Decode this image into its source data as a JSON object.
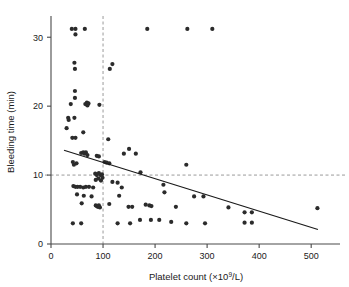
{
  "chart_data": {
    "type": "scatter",
    "title": "",
    "xlabel": "Platelet count (×10⁹/L)",
    "xlabel_parts": {
      "before": "Platelet count (×10",
      "exponent": "9",
      "after": "/L)"
    },
    "ylabel": "Bleeding time (min)",
    "xlim": [
      0,
      540
    ],
    "ylim": [
      0,
      32.5
    ],
    "xticks": [
      0,
      100,
      200,
      300,
      400,
      500
    ],
    "xticklabels": [
      "0",
      "100",
      "200",
      "300",
      "400",
      "500"
    ],
    "yticks": [
      0,
      10,
      20,
      30
    ],
    "yticklabels": [
      "0",
      "10",
      "20",
      "30"
    ],
    "grid": false,
    "legend": null,
    "reference_lines": [
      {
        "name": "vertical-threshold",
        "orientation": "vertical",
        "value": 100,
        "style": "dashed",
        "color": "#9a9a9a"
      },
      {
        "name": "horizontal-threshold",
        "orientation": "horizontal",
        "value": 10,
        "style": "dashed",
        "color": "#9a9a9a"
      }
    ],
    "fit_line": {
      "name": "regression-line",
      "x_start": 25,
      "y_start": 13.6,
      "x_end": 513,
      "y_end": 2.1,
      "color": "#1a1a1a"
    },
    "marker": {
      "shape": "circle",
      "radius": 2.1,
      "color": "#2b2b2b"
    },
    "points": [
      [
        40,
        31.2
      ],
      [
        47,
        31.2
      ],
      [
        47,
        30.4
      ],
      [
        65,
        31.2
      ],
      [
        185,
        31.2
      ],
      [
        262,
        31.2
      ],
      [
        310,
        31.2
      ],
      [
        45,
        26.3
      ],
      [
        46,
        25.4
      ],
      [
        118,
        26.1
      ],
      [
        113,
        25.4
      ],
      [
        46,
        22.2
      ],
      [
        46,
        21.2
      ],
      [
        38,
        20.3
      ],
      [
        66,
        20.3
      ],
      [
        69,
        20.5
      ],
      [
        70,
        20.1
      ],
      [
        72,
        20.4
      ],
      [
        93,
        20.2
      ],
      [
        33,
        18.3
      ],
      [
        34,
        18.0
      ],
      [
        45,
        18.3
      ],
      [
        30,
        16.8
      ],
      [
        62,
        16.2
      ],
      [
        41,
        15.4
      ],
      [
        47,
        15.4
      ],
      [
        110,
        15.2
      ],
      [
        150,
        13.8
      ],
      [
        58,
        13.2
      ],
      [
        62,
        13.3
      ],
      [
        64,
        13.1
      ],
      [
        67,
        13.3
      ],
      [
        70,
        12.9
      ],
      [
        88,
        12.8
      ],
      [
        92,
        12.7
      ],
      [
        140,
        13.1
      ],
      [
        163,
        13.1
      ],
      [
        42,
        11.9
      ],
      [
        49,
        11.7
      ],
      [
        44,
        11.5
      ],
      [
        103,
        11.9
      ],
      [
        107,
        11.8
      ],
      [
        112,
        11.7
      ],
      [
        260,
        11.5
      ],
      [
        85,
        10.2
      ],
      [
        88,
        10.0
      ],
      [
        92,
        10.3
      ],
      [
        95,
        10.0
      ],
      [
        98,
        10.1
      ],
      [
        99,
        9.6
      ],
      [
        91,
        9.5
      ],
      [
        86,
        9.3
      ],
      [
        96,
        9.2
      ],
      [
        172,
        10.4
      ],
      [
        43,
        8.4
      ],
      [
        47,
        8.3
      ],
      [
        51,
        8.3
      ],
      [
        56,
        8.3
      ],
      [
        62,
        8.2
      ],
      [
        67,
        8.3
      ],
      [
        73,
        8.3
      ],
      [
        81,
        8.2
      ],
      [
        118,
        9.0
      ],
      [
        128,
        8.9
      ],
      [
        136,
        8.2
      ],
      [
        216,
        8.6
      ],
      [
        50,
        7.2
      ],
      [
        63,
        7.0
      ],
      [
        78,
        6.9
      ],
      [
        131,
        7.0
      ],
      [
        218,
        7.5
      ],
      [
        275,
        6.9
      ],
      [
        293,
        6.9
      ],
      [
        59,
        5.9
      ],
      [
        86,
        5.6
      ],
      [
        88,
        5.5
      ],
      [
        90,
        5.4
      ],
      [
        92,
        5.6
      ],
      [
        94,
        5.3
      ],
      [
        112,
        5.8
      ],
      [
        149,
        5.4
      ],
      [
        156,
        5.4
      ],
      [
        182,
        5.7
      ],
      [
        189,
        5.6
      ],
      [
        193,
        5.5
      ],
      [
        240,
        5.4
      ],
      [
        341,
        5.3
      ],
      [
        512,
        5.2
      ],
      [
        372,
        4.6
      ],
      [
        386,
        4.6
      ],
      [
        42,
        3.0
      ],
      [
        58,
        3.0
      ],
      [
        128,
        3.0
      ],
      [
        152,
        3.0
      ],
      [
        171,
        3.5
      ],
      [
        192,
        3.5
      ],
      [
        208,
        3.5
      ],
      [
        231,
        3.2
      ],
      [
        260,
        3.0
      ],
      [
        296,
        3.0
      ],
      [
        372,
        3.1
      ],
      [
        386,
        3.1
      ]
    ]
  },
  "layout": {
    "plot_left_px": 51,
    "plot_right_px": 332,
    "plot_bottom_px": 244,
    "plot_top_px": 20
  }
}
